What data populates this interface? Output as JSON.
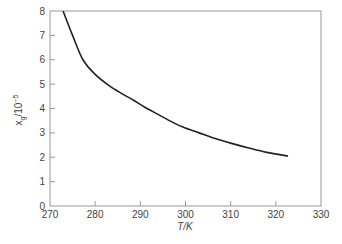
{
  "chart_data": {
    "type": "line",
    "title": "",
    "xlabel": "T/K",
    "ylabel": "x_g/10^-5",
    "ylabel_parts": {
      "base": "x",
      "sub": "g",
      "rest": "/10",
      "sup": "−5"
    },
    "xlim": [
      270,
      330
    ],
    "ylim": [
      0,
      8
    ],
    "xticks": [
      270,
      280,
      290,
      300,
      310,
      320,
      330
    ],
    "yticks": [
      0,
      1,
      2,
      3,
      4,
      5,
      6,
      7,
      8
    ],
    "grid": false,
    "legend": null,
    "series": [
      {
        "name": "x_g",
        "x": [
          272.9,
          275,
          277.3,
          280,
          283,
          286,
          288.4,
          291,
          294,
          297,
          299.4,
          303,
          306,
          310,
          314,
          318,
          322.7
        ],
        "y": [
          8.0,
          7.0,
          6.0,
          5.4,
          4.95,
          4.6,
          4.35,
          4.05,
          3.75,
          3.45,
          3.24,
          3.0,
          2.8,
          2.58,
          2.38,
          2.2,
          2.05
        ]
      }
    ],
    "line_color": "#222222"
  }
}
